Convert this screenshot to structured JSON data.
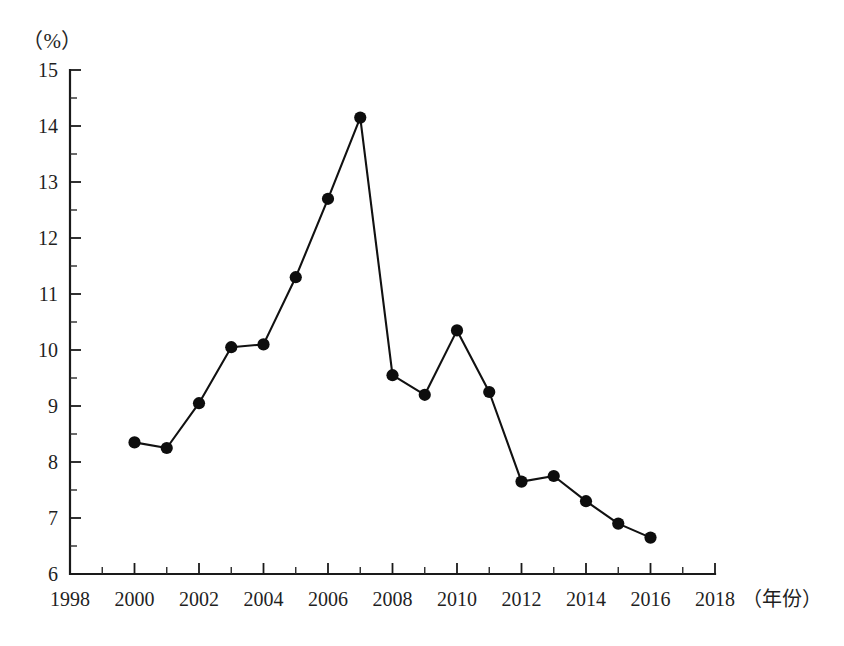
{
  "chart_data": {
    "type": "line",
    "title": "",
    "subtitle": "",
    "xlabel": "（年份）",
    "ylabel": "（%）",
    "unit_label": "（%）",
    "xlim": [
      1998,
      2018
    ],
    "ylim": [
      6,
      15
    ],
    "x_tick_step": 2,
    "y_tick_step": 1,
    "y_minor_step": 0.5,
    "grid": false,
    "legend": null,
    "x_tick_labels": [
      "1998",
      "2000",
      "2002",
      "2004",
      "2006",
      "2008",
      "2010",
      "2012",
      "2014",
      "2016",
      "2018"
    ],
    "y_tick_labels": [
      "6",
      "7",
      "8",
      "9",
      "10",
      "11",
      "12",
      "13",
      "14",
      "15"
    ],
    "x": [
      2000,
      2001,
      2002,
      2003,
      2004,
      2005,
      2006,
      2007,
      2008,
      2009,
      2010,
      2011,
      2012,
      2013,
      2014,
      2015,
      2016
    ],
    "values": [
      8.35,
      8.25,
      9.05,
      10.05,
      10.1,
      11.3,
      12.7,
      14.15,
      9.55,
      9.2,
      10.35,
      9.25,
      7.65,
      7.75,
      7.3,
      6.9,
      6.65
    ],
    "series": [
      {
        "name": "",
        "marker": "filled-circle",
        "color": "#111111",
        "values": [
          8.35,
          8.25,
          9.05,
          10.05,
          10.1,
          11.3,
          12.7,
          14.15,
          9.55,
          9.2,
          10.35,
          9.25,
          7.65,
          7.75,
          7.3,
          6.9,
          6.65
        ]
      }
    ],
    "annotations": []
  },
  "colors": {
    "line": "#111111",
    "marker": "#0d0d0d",
    "axis": "#1a1a1a",
    "background": "#ffffff"
  }
}
